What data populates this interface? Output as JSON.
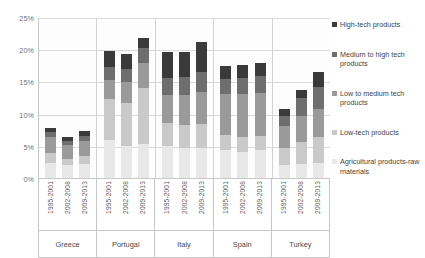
{
  "chart_data": {
    "type": "bar",
    "subtype": "stacked-bar-grouped",
    "title": "",
    "xlabel": "",
    "ylabel": "",
    "ylim": [
      0,
      25
    ],
    "ytick_labels": [
      "0%",
      "5%",
      "10%",
      "15%",
      "20%",
      "25%"
    ],
    "ytick_values": [
      0,
      5,
      10,
      15,
      20,
      25
    ],
    "grid": true,
    "legend_position": "right",
    "categories": [
      "Greece",
      "Portugal",
      "Italy",
      "Spain",
      "Turkey"
    ],
    "periods": [
      "1995-2001",
      "2002-2008",
      "2009-2013"
    ],
    "series": [
      {
        "name": "Agricultural products-raw materials",
        "color": "#e8e8e8",
        "values": [
          [
            2.3,
            2.0,
            2.2
          ],
          [
            5.9,
            4.9,
            5.3
          ],
          [
            4.9,
            4.6,
            4.6
          ],
          [
            4.4,
            4.1,
            4.3
          ],
          [
            2.0,
            2.2,
            2.4
          ]
        ]
      },
      {
        "name": "Low-tech products",
        "color": "#c9c9c9",
        "values": [
          [
            1.6,
            1.0,
            1.2
          ],
          [
            6.3,
            6.8,
            8.7
          ],
          [
            3.6,
            3.7,
            3.8
          ],
          [
            2.3,
            2.2,
            2.3
          ],
          [
            2.7,
            3.4,
            3.9
          ]
        ]
      },
      {
        "name": "Low to medium tech products",
        "color": "#9a9a9a",
        "values": [
          [
            2.4,
            2.1,
            2.3
          ],
          [
            3.0,
            3.2,
            3.8
          ],
          [
            4.4,
            4.6,
            4.9
          ],
          [
            6.3,
            6.7,
            6.6
          ],
          [
            3.4,
            4.0,
            4.4
          ]
        ]
      },
      {
        "name": "Medium to high tech products",
        "color": "#6e6e6e",
        "values": [
          [
            0.8,
            0.7,
            0.9
          ],
          [
            2.0,
            2.1,
            2.4
          ],
          [
            2.6,
            2.8,
            3.1
          ],
          [
            2.4,
            2.6,
            2.6
          ],
          [
            1.6,
            2.8,
            3.4
          ]
        ]
      },
      {
        "name": "High-tech products",
        "color": "#3a3a3a",
        "values": [
          [
            0.6,
            0.6,
            0.7
          ],
          [
            2.5,
            2.2,
            1.6
          ],
          [
            4.1,
            3.8,
            4.8
          ],
          [
            2.0,
            1.9,
            2.1
          ],
          [
            1.0,
            1.3,
            2.3
          ]
        ]
      }
    ],
    "totals": [
      [
        7.7,
        6.4,
        7.3
      ],
      [
        19.7,
        19.2,
        21.8
      ],
      [
        19.6,
        19.5,
        21.2
      ],
      [
        17.4,
        17.5,
        17.9
      ],
      [
        10.7,
        13.7,
        16.4
      ]
    ]
  },
  "legend": {
    "entries": [
      "High-tech products",
      "Medium to high tech products",
      "Low to medium tech products",
      "Low-tech products",
      "Agricultural products-raw materials"
    ]
  }
}
